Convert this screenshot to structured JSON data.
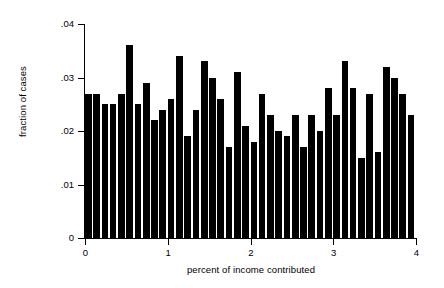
{
  "chart_data": {
    "type": "bar",
    "title": "",
    "subtitle": "",
    "xlabel": "percent of income contributed",
    "ylabel": "fraction of cases",
    "xlim": [
      0,
      4
    ],
    "ylim": [
      0,
      0.04
    ],
    "grid": false,
    "legend": null,
    "bar_width_data": 0.1,
    "x_tick_labels": [
      "0",
      "1",
      "2",
      "3",
      "4"
    ],
    "x_tick_values": [
      0,
      1,
      2,
      3,
      4
    ],
    "y_tick_labels": [
      "0",
      ".01",
      ".02",
      ".03",
      ".04"
    ],
    "y_tick_values": [
      0,
      0.01,
      0.02,
      0.03,
      0.04
    ],
    "categories": [
      "0.00",
      "0.10",
      "0.20",
      "0.30",
      "0.40",
      "0.50",
      "0.60",
      "0.70",
      "0.80",
      "0.90",
      "1.00",
      "1.10",
      "1.20",
      "1.30",
      "1.40",
      "1.50",
      "1.60",
      "1.70",
      "1.80",
      "1.90",
      "2.00",
      "2.10",
      "2.20",
      "2.30",
      "2.40",
      "2.50",
      "2.60",
      "2.70",
      "2.80",
      "2.90",
      "3.00",
      "3.10",
      "3.20",
      "3.30",
      "3.40",
      "3.50",
      "3.60",
      "3.70",
      "3.80",
      "3.90"
    ],
    "values": [
      0.027,
      0.027,
      0.025,
      0.025,
      0.027,
      0.036,
      0.025,
      0.029,
      0.022,
      0.024,
      0.026,
      0.034,
      0.019,
      0.024,
      0.033,
      0.03,
      0.026,
      0.017,
      0.031,
      0.021,
      0.018,
      0.027,
      0.023,
      0.02,
      0.019,
      0.023,
      0.017,
      0.023,
      0.02,
      0.028,
      0.023,
      0.033,
      0.028,
      0.015,
      0.027,
      0.016,
      0.032,
      0.03,
      0.027,
      0.023
    ],
    "bar_color": "#000000",
    "background_color": "#ffffff"
  }
}
